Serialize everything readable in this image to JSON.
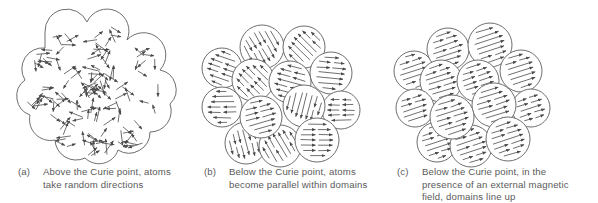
{
  "panels": [
    {
      "id": "a",
      "tag": "(a)",
      "caption_lines": [
        "Above the Curie point, atoms",
        "take random directions"
      ],
      "state": "random",
      "outline": "scalloped-blob"
    },
    {
      "id": "b",
      "tag": "(b)",
      "caption_lines": [
        "Below the Curie point, atoms",
        "become parallel within domains"
      ],
      "state": "aligned-within-domains",
      "domain_count": 13
    },
    {
      "id": "c",
      "tag": "(c)",
      "caption_lines": [
        "Below the Curie point, in the",
        "presence of an external magnetic",
        "field, domains line up"
      ],
      "state": "all-domains-aligned",
      "domain_count": 13
    }
  ],
  "colors": {
    "stroke": "#6e6e6e",
    "arrow": "#4a4a4a",
    "text": "#5a5a5a",
    "background": "#ffffff"
  }
}
